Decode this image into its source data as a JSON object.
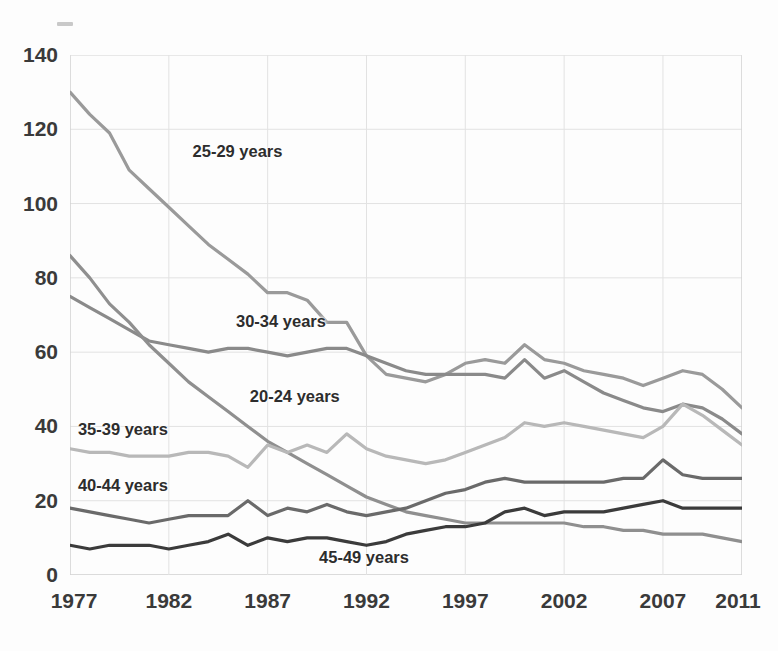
{
  "chart_data": {
    "type": "line",
    "title": "",
    "xlabel": "",
    "ylabel": "",
    "xlim": [
      1977,
      2011
    ],
    "ylim": [
      0,
      140
    ],
    "ytick_values": [
      0,
      20,
      40,
      60,
      80,
      100,
      120,
      140
    ],
    "ytick_labels": [
      "0",
      "20",
      "40",
      "60",
      "80",
      "100",
      "120",
      "140"
    ],
    "xtick_values": [
      1977,
      1982,
      1987,
      1992,
      1997,
      2002,
      2007,
      2011
    ],
    "xtick_labels": [
      "1977",
      "1982",
      "1987",
      "1992",
      "1997",
      "2002",
      "2007",
      "2011"
    ],
    "grid": true,
    "legend_position": "inline-annotations",
    "x": [
      1977,
      1978,
      1979,
      1980,
      1981,
      1982,
      1983,
      1984,
      1985,
      1986,
      1987,
      1988,
      1989,
      1990,
      1991,
      1992,
      1993,
      1994,
      1995,
      1996,
      1997,
      1998,
      1999,
      2000,
      2001,
      2002,
      2003,
      2004,
      2005,
      2006,
      2007,
      2008,
      2009,
      2010,
      2011
    ],
    "series": [
      {
        "name": "25-29 years",
        "color": "#9a9a9a",
        "label": "25-29 years",
        "values": [
          130,
          124,
          119,
          109,
          104,
          99,
          94,
          89,
          85,
          81,
          76,
          76,
          74,
          68,
          68,
          59,
          54,
          53,
          52,
          54,
          57,
          58,
          57,
          62,
          58,
          57,
          55,
          54,
          53,
          51,
          53,
          55,
          54,
          50,
          45
        ]
      },
      {
        "name": "30-34 years",
        "color": "#8a8a8a",
        "label": "30-34 years",
        "values": [
          75,
          72,
          69,
          66,
          63,
          62,
          61,
          60,
          61,
          61,
          60,
          59,
          60,
          61,
          61,
          59,
          57,
          55,
          54,
          54,
          54,
          54,
          53,
          58,
          53,
          55,
          52,
          49,
          47,
          45,
          44,
          46,
          45,
          42,
          38
        ]
      },
      {
        "name": "20-24 years",
        "color": "#8f8f8f",
        "label": "20-24 years",
        "values": [
          86,
          80,
          73,
          68,
          62,
          57,
          52,
          48,
          44,
          40,
          36,
          33,
          30,
          27,
          24,
          21,
          19,
          17,
          16,
          15,
          14,
          14,
          14,
          14,
          14,
          14,
          13,
          13,
          12,
          12,
          11,
          11,
          11,
          10,
          9
        ]
      },
      {
        "name": "35-39 years",
        "color": "#b8b8b8",
        "label": "35-39 years",
        "values": [
          34,
          33,
          33,
          32,
          32,
          32,
          33,
          33,
          32,
          29,
          35,
          33,
          35,
          33,
          38,
          34,
          32,
          31,
          30,
          31,
          33,
          35,
          37,
          41,
          40,
          41,
          40,
          39,
          38,
          37,
          40,
          46,
          43,
          39,
          35
        ]
      },
      {
        "name": "40-44 years",
        "color": "#6b6b6b",
        "label": "40-44 years",
        "values": [
          18,
          17,
          16,
          15,
          14,
          15,
          16,
          16,
          16,
          20,
          16,
          18,
          17,
          19,
          17,
          16,
          17,
          18,
          20,
          22,
          23,
          25,
          26,
          25,
          25,
          25,
          25,
          25,
          26,
          26,
          31,
          27,
          26,
          26,
          26
        ]
      },
      {
        "name": "45-49 years",
        "color": "#3b3b3b",
        "label": "45-49 years",
        "values": [
          8,
          7,
          8,
          8,
          8,
          7,
          8,
          9,
          11,
          8,
          10,
          9,
          10,
          10,
          9,
          8,
          9,
          11,
          12,
          13,
          13,
          14,
          17,
          18,
          16,
          17,
          17,
          17,
          18,
          19,
          20,
          18,
          18,
          18,
          18
        ]
      }
    ]
  },
  "axis": {
    "y_title": "",
    "x_title": ""
  },
  "annotations": [
    {
      "text": "25-29 years",
      "x": 1983.2,
      "y": 114
    },
    {
      "text": "30-34 years",
      "x": 1985.4,
      "y": 68
    },
    {
      "text": "20-24 years",
      "x": 1986.1,
      "y": 48
    },
    {
      "text": "35-39 years",
      "x": 1977.4,
      "y": 39
    },
    {
      "text": "40-44 years",
      "x": 1977.4,
      "y": 24
    },
    {
      "text": "45-49 years",
      "x": 1989.6,
      "y": 4.5
    }
  ],
  "style": {
    "grid_color": "#e2e2e2",
    "axis_color": "#cfcfcf",
    "tick_text_color": "#3a3a3a",
    "background": "#fdfdfd"
  }
}
